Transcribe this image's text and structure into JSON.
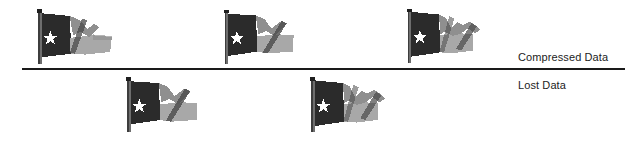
{
  "figure": {
    "type": "diagram",
    "background_color": "#ffffff",
    "width": 641,
    "height": 143
  },
  "divider": {
    "name": "horizontal-divider-line",
    "x": 22,
    "y": 68,
    "width": 603,
    "height": 2,
    "color": "#1a1a1a"
  },
  "labels": [
    {
      "id": "compressed",
      "text": "Compressed Data",
      "x": 518,
      "y": 51,
      "color": "#1c1c1c"
    },
    {
      "id": "lost",
      "text": "Lost Data",
      "x": 518,
      "y": 79,
      "color": "#1c1c1c"
    }
  ],
  "colors": {
    "flag_dark_field": "#2b2b2b",
    "flag_dark_field_shade": "#1f1f1f",
    "flag_mid_gray": "#8f8f8f",
    "flag_light_gray": "#a8a8a8",
    "flag_band_dark": "#4a4a4a",
    "flag_pole": "#6e6e6e",
    "flag_pole_dark": "#3d3d3d",
    "star": "#ffffff",
    "text": "#1c1c1c",
    "line": "#1a1a1a"
  },
  "groups": [
    {
      "id": "compressed-data-row",
      "label_ref": "compressed",
      "position": "above-divider",
      "count": 3
    },
    {
      "id": "lost-data-row",
      "label_ref": "lost",
      "position": "below-divider",
      "count": 2
    }
  ],
  "flags": [
    {
      "id": "flag-1",
      "group": "compressed-data-row",
      "alt": "waving flag with white star",
      "x": 30,
      "y": 8,
      "width": 90,
      "height": 58,
      "variant": 1
    },
    {
      "id": "flag-2",
      "group": "compressed-data-row",
      "alt": "waving flag with white star",
      "x": 218,
      "y": 8,
      "width": 86,
      "height": 58,
      "variant": 2
    },
    {
      "id": "flag-3",
      "group": "compressed-data-row",
      "alt": "waving flag with white star",
      "x": 401,
      "y": 6,
      "width": 86,
      "height": 60,
      "variant": 3
    },
    {
      "id": "flag-4",
      "group": "lost-data-row",
      "alt": "waving flag with white star",
      "x": 120,
      "y": 76,
      "width": 88,
      "height": 58,
      "variant": 2
    },
    {
      "id": "flag-5",
      "group": "lost-data-row",
      "alt": "waving flag with white star",
      "x": 303,
      "y": 76,
      "width": 90,
      "height": 58,
      "variant": 3
    }
  ]
}
